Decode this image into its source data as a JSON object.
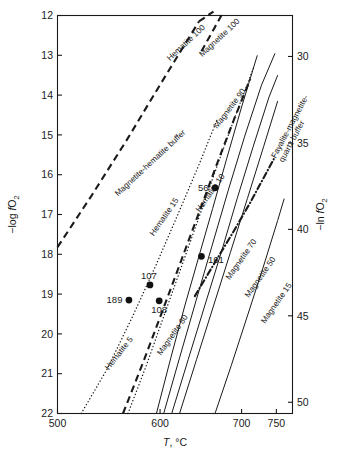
{
  "chart_data": {
    "type": "line",
    "title": "",
    "xlabel": "T, °C",
    "ylabel": "−log fO₂",
    "y2label": "−ln fO₂",
    "xticks": [
      500,
      600,
      700,
      750
    ],
    "xticklabels": [
      "500",
      "600",
      "700",
      "750"
    ],
    "yticks": [
      12,
      13,
      14,
      15,
      16,
      17,
      18,
      19,
      20,
      21,
      22
    ],
    "yticklabels": [
      "12",
      "13",
      "14",
      "15",
      "16",
      "17",
      "18",
      "19",
      "20",
      "21",
      "22"
    ],
    "y2ticks": [
      30,
      35,
      40,
      45,
      50
    ],
    "y2ticklabels": [
      "30",
      "35",
      "40",
      "45",
      "50"
    ],
    "xlim": [
      500,
      775
    ],
    "ylim": [
      22,
      12
    ],
    "y2lim": [
      50.65,
      27.63
    ],
    "grid": false,
    "legend": "none (curves labeled in place)",
    "series": [
      {
        "name": "Magnetite-hematite buffer",
        "label": "Magnetite-hematite buffer",
        "style": "dashed-heavy",
        "label_x": 556,
        "label_y": 16.55,
        "label_rot": -43,
        "points": [
          [
            500,
            17.82
          ],
          [
            530,
            16.55
          ],
          [
            565,
            15.12
          ],
          [
            600,
            13.74
          ],
          [
            630,
            12.66
          ],
          [
            645,
            12.15
          ]
        ]
      },
      {
        "name": "Hematite 100",
        "label": "Hematite 100",
        "style": "label-only",
        "label_x": 611,
        "label_y": 13.15,
        "label_rot": -43
      },
      {
        "name": "Magnetite 100",
        "label": "Magnetite 100",
        "style": "label-only",
        "label_x": 649,
        "label_y": 13.05,
        "label_rot": -43
      },
      {
        "name": "Hematite 5",
        "label": "Hematite 5",
        "style": "dotted",
        "label_x": 547,
        "label_y": 20.92,
        "label_rot": -52,
        "points": [
          [
            521,
            22.0
          ],
          [
            545,
            20.9
          ],
          [
            570,
            19.6
          ],
          [
            595,
            18.3
          ],
          [
            620,
            17.0
          ],
          [
            645,
            15.75
          ],
          [
            668,
            14.6
          ]
        ]
      },
      {
        "name": "Hematite 15",
        "label": "Hematite 15",
        "style": "solid",
        "label_x": 593,
        "label_y": 17.55,
        "label_rot": -55,
        "points": [
          [
            596,
            22.0
          ],
          [
            612,
            20.6
          ],
          [
            628,
            19.3
          ],
          [
            645,
            18.05
          ],
          [
            662,
            16.85
          ],
          [
            680,
            15.6
          ],
          [
            700,
            14.3
          ],
          [
            722,
            13.0
          ]
        ]
      },
      {
        "name": "Hematite 10",
        "label": "Hematite 10",
        "style": "dotted",
        "label_x": 646,
        "label_y": 16.95,
        "label_rot": -55,
        "points": [
          [
            566,
            22.0
          ],
          [
            585,
            20.8
          ],
          [
            605,
            19.5
          ],
          [
            626,
            18.2
          ],
          [
            648,
            16.9
          ],
          [
            670,
            15.65
          ],
          [
            694,
            14.4
          ],
          [
            718,
            13.25
          ]
        ]
      },
      {
        "name": "Magnetite 80",
        "label": "Magnetite 80",
        "style": "dashed-heavy",
        "label_x": 601,
        "label_y": 20.55,
        "label_rot": -55,
        "points": [
          [
            561,
            22.0
          ],
          [
            582,
            20.7
          ],
          [
            603,
            19.4
          ],
          [
            624,
            18.15
          ],
          [
            646,
            16.9
          ],
          [
            668,
            15.7
          ],
          [
            690,
            14.6
          ],
          [
            712,
            13.6
          ]
        ]
      },
      {
        "name": "Magnetite 90",
        "label": "Magnetite 90",
        "style": "solid",
        "label_x": 668,
        "label_y": 14.85,
        "label_rot": -53,
        "points": [
          [
            604,
            22.0
          ],
          [
            622,
            20.6
          ],
          [
            641,
            19.2
          ],
          [
            661,
            17.8
          ],
          [
            682,
            16.4
          ],
          [
            704,
            15.05
          ],
          [
            728,
            13.75
          ],
          [
            748,
            12.95
          ]
        ]
      },
      {
        "name": "Magnetite 70",
        "label": "Magnetite 70",
        "style": "solid",
        "label_x": 684,
        "label_y": 18.65,
        "label_rot": -55,
        "points": [
          [
            613,
            22.0
          ],
          [
            632,
            20.65
          ],
          [
            652,
            19.3
          ],
          [
            673,
            17.95
          ],
          [
            694,
            16.6
          ],
          [
            716,
            15.3
          ],
          [
            739,
            14.05
          ],
          [
            752,
            13.5
          ]
        ]
      },
      {
        "name": "Magnetite 50",
        "label": "Magnetite 50",
        "style": "solid",
        "label_x": 710,
        "label_y": 19.1,
        "label_rot": -55,
        "points": [
          [
            622,
            22.0
          ],
          [
            642,
            20.65
          ],
          [
            663,
            19.3
          ],
          [
            685,
            17.95
          ],
          [
            708,
            16.6
          ],
          [
            731,
            15.3
          ],
          [
            752,
            14.15
          ]
        ]
      },
      {
        "name": "Magnetite 15",
        "label": "Magnetite 15",
        "style": "solid",
        "label_x": 733,
        "label_y": 19.75,
        "label_rot": -55,
        "points": [
          [
            665,
            22.0
          ],
          [
            686,
            20.8
          ],
          [
            708,
            19.55
          ],
          [
            730,
            18.35
          ],
          [
            752,
            17.15
          ],
          [
            762,
            16.6
          ]
        ]
      },
      {
        "name": "Fayalite-magnetite-quartz buffer",
        "label": "Fayalite-magnetite-quartz buffer",
        "style": "dashdot-heavy",
        "label_x": 749,
        "label_y": 15.6,
        "label_rot": -62,
        "points": [
          [
            640,
            19.05
          ],
          [
            665,
            18.2
          ],
          [
            690,
            17.4
          ],
          [
            712,
            16.7
          ],
          [
            732,
            16.05
          ],
          [
            748,
            15.55
          ]
        ]
      }
    ],
    "data_points": [
      {
        "label": "56",
        "x": 665,
        "y": 16.33,
        "label_pos": "left"
      },
      {
        "label": "161",
        "x": 648,
        "y": 18.05,
        "label_pos": "right"
      },
      {
        "label": "107",
        "x": 589,
        "y": 18.77,
        "label_pos": "above"
      },
      {
        "label": "108",
        "x": 599,
        "y": 19.17,
        "label_pos": "below"
      },
      {
        "label": "189",
        "x": 567,
        "y": 19.15,
        "label_pos": "left"
      }
    ]
  }
}
